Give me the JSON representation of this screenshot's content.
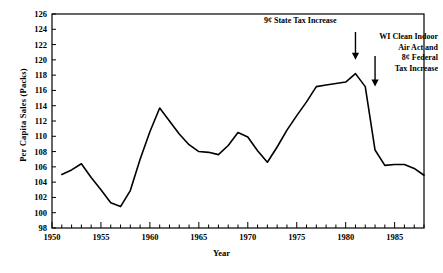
{
  "chart_data": {
    "type": "line",
    "title": "",
    "xlabel": "Year",
    "ylabel": "Per Capita Sales (Packs)",
    "xlim": [
      1950,
      1988
    ],
    "ylim": [
      98,
      126
    ],
    "grid": false,
    "legend": "none",
    "y_ticks": [
      98,
      100,
      102,
      104,
      106,
      108,
      110,
      112,
      114,
      116,
      118,
      120,
      122,
      124,
      126
    ],
    "x_ticks": [
      1950,
      1955,
      1960,
      1965,
      1970,
      1975,
      1980,
      1985
    ],
    "x_minor_tick_step": 1,
    "line_color": "#000000",
    "series": [
      {
        "name": "Per Capita Sales (Packs)",
        "x": [
          1951,
          1952,
          1953,
          1954,
          1955,
          1956,
          1957,
          1958,
          1959,
          1960,
          1961,
          1962,
          1963,
          1964,
          1965,
          1966,
          1967,
          1968,
          1969,
          1970,
          1971,
          1972,
          1973,
          1974,
          1975,
          1976,
          1977,
          1978,
          1979,
          1980,
          1981,
          1982,
          1983,
          1984,
          1985,
          1986,
          1987,
          1988
        ],
        "values": [
          105.0,
          105.6,
          106.4,
          104.6,
          103.0,
          101.3,
          100.8,
          102.9,
          107.0,
          110.6,
          113.7,
          112.0,
          110.3,
          108.9,
          108.0,
          107.9,
          107.6,
          108.8,
          110.5,
          109.9,
          108.1,
          106.6,
          108.6,
          110.8,
          112.7,
          114.5,
          116.5,
          116.7,
          116.9,
          117.1,
          118.2,
          116.5,
          108.2,
          106.2,
          106.3,
          106.3,
          105.8,
          104.9
        ]
      }
    ],
    "annotations": [
      {
        "id": "state-tax-increase",
        "text": "9¢ State Tax Increase",
        "arrow_year": 1981,
        "arrow_to_value": 120.0
      },
      {
        "id": "clean-indoor-air-act",
        "text_lines": [
          "WI Clean Indoor",
          "Air Act and",
          "8¢ Federal",
          "Tax Increase"
        ],
        "arrow_year": 1983,
        "arrow_to_value": 116.5
      }
    ]
  },
  "axis": {
    "y_label": "Per Capita Sales (Packs)",
    "x_label": "Year",
    "y_tick_labels": [
      "126",
      "124",
      "122",
      "120",
      "118",
      "116",
      "114",
      "112",
      "110",
      "108",
      "106",
      "104",
      "102",
      "100",
      "98"
    ],
    "x_tick_labels": [
      "1950",
      "1955",
      "1960",
      "1965",
      "1970",
      "1975",
      "1980",
      "1985"
    ]
  },
  "annotation_text": {
    "left": "9¢ State Tax Increase",
    "right_line1": "WI Clean Indoor",
    "right_line2": "Air Act and",
    "right_line3": "8¢ Federal",
    "right_line4": "Tax Increase"
  }
}
